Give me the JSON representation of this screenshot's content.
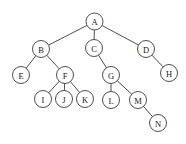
{
  "diagram": {
    "type": "rooted-tree",
    "canvas": {
      "width": 186,
      "height": 144,
      "background": "#ffffff"
    },
    "style": {
      "node_fill": "#ffffff",
      "node_stroke": "#3a3a3a",
      "edge_stroke": "#3a3a3a",
      "label_color": "#1a1a1a",
      "node_radius": 8.5
    },
    "root": "A",
    "nodes": [
      {
        "id": "A",
        "label": "A",
        "x": 94.5,
        "y": 21.5,
        "r": 8.5,
        "depth": 0
      },
      {
        "id": "B",
        "label": "B",
        "x": 41,
        "y": 49,
        "r": 8.5,
        "depth": 1
      },
      {
        "id": "C",
        "label": "C",
        "x": 94,
        "y": 48,
        "r": 8.5,
        "depth": 1
      },
      {
        "id": "D",
        "label": "D",
        "x": 146,
        "y": 49,
        "r": 8.5,
        "depth": 1
      },
      {
        "id": "E",
        "label": "E",
        "x": 21,
        "y": 75,
        "r": 8.5,
        "depth": 2
      },
      {
        "id": "F",
        "label": "F",
        "x": 65,
        "y": 75,
        "r": 8.5,
        "depth": 2
      },
      {
        "id": "G",
        "label": "G",
        "x": 111,
        "y": 75,
        "r": 8.5,
        "depth": 2
      },
      {
        "id": "H",
        "label": "H",
        "x": 169,
        "y": 73,
        "r": 8.5,
        "depth": 2
      },
      {
        "id": "I",
        "label": "I",
        "x": 43,
        "y": 99,
        "r": 8.5,
        "depth": 3
      },
      {
        "id": "J",
        "label": "J",
        "x": 64,
        "y": 99,
        "r": 8.5,
        "depth": 3
      },
      {
        "id": "K",
        "label": "K",
        "x": 85,
        "y": 99,
        "r": 8.5,
        "depth": 3
      },
      {
        "id": "L",
        "label": "L",
        "x": 111,
        "y": 100,
        "r": 8.5,
        "depth": 3
      },
      {
        "id": "M",
        "label": "M",
        "x": 138,
        "y": 100,
        "r": 8.5,
        "depth": 3
      },
      {
        "id": "N",
        "label": "N",
        "x": 158,
        "y": 123,
        "r": 8.5,
        "depth": 4
      }
    ],
    "edges": [
      {
        "from": "A",
        "to": "B"
      },
      {
        "from": "A",
        "to": "C"
      },
      {
        "from": "A",
        "to": "D"
      },
      {
        "from": "B",
        "to": "E"
      },
      {
        "from": "B",
        "to": "F"
      },
      {
        "from": "C",
        "to": "G"
      },
      {
        "from": "D",
        "to": "H"
      },
      {
        "from": "F",
        "to": "I"
      },
      {
        "from": "F",
        "to": "J"
      },
      {
        "from": "F",
        "to": "K"
      },
      {
        "from": "G",
        "to": "L"
      },
      {
        "from": "G",
        "to": "M"
      },
      {
        "from": "M",
        "to": "N"
      }
    ]
  }
}
